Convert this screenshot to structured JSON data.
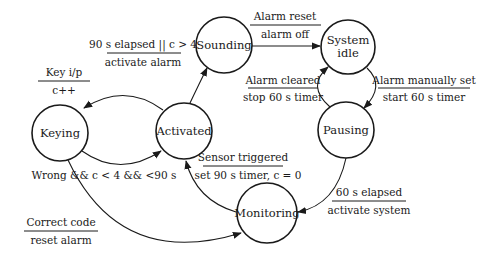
{
  "diagram": {
    "type": "state-machine",
    "states": [
      {
        "id": "sounding",
        "label": "Sounding"
      },
      {
        "id": "system-idle",
        "label_line1": "System",
        "label_line2": "idle"
      },
      {
        "id": "pausing",
        "label": "Pausing"
      },
      {
        "id": "activated",
        "label": "Activated"
      },
      {
        "id": "keying",
        "label": "Keying"
      },
      {
        "id": "monitoring",
        "label": "Monitoring"
      }
    ],
    "transitions": [
      {
        "from": "activated",
        "to": "sounding",
        "event": "90 s elapsed || c > 4",
        "action": "activate alarm"
      },
      {
        "from": "sounding",
        "to": "system-idle",
        "event": "Alarm reset",
        "action": "alarm off"
      },
      {
        "from": "pausing",
        "to": "system-idle",
        "event": "Alarm cleared",
        "action": "stop 60 s timer"
      },
      {
        "from": "system-idle",
        "to": "pausing",
        "event": "Alarm manually set",
        "action": "start 60 s timer"
      },
      {
        "from": "activated",
        "to": "keying",
        "event": "Key i/p",
        "action": "c++"
      },
      {
        "from": "keying",
        "to": "activated",
        "event": "Wrong && c < 4 && <90 s"
      },
      {
        "from": "monitoring",
        "to": "activated",
        "event": "Sensor triggered",
        "action": "set 90 s timer, c = 0"
      },
      {
        "from": "pausing",
        "to": "monitoring",
        "event": "60 s elapsed",
        "action": "activate system"
      },
      {
        "from": "keying",
        "to": "monitoring",
        "event": "Correct code",
        "action": "reset alarm"
      }
    ]
  },
  "colors": {
    "stroke": "#1a1a1a",
    "background": "#ffffff"
  }
}
